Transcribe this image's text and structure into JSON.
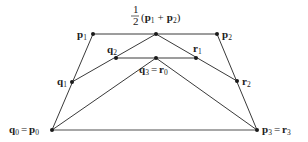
{
  "diagram": {
    "points": {
      "p0": {
        "name": "p",
        "sub": "0",
        "eq_name": "q",
        "eq_sub": "0"
      },
      "p1": {
        "name": "p",
        "sub": "1"
      },
      "p2": {
        "name": "p",
        "sub": "2"
      },
      "p3": {
        "name": "p",
        "sub": "3",
        "eq_name": "r",
        "eq_sub": "3"
      },
      "q1": {
        "name": "q",
        "sub": "1"
      },
      "q2": {
        "name": "q",
        "sub": "2"
      },
      "q3": {
        "name": "q",
        "sub": "3",
        "eq_name": "r",
        "eq_sub": "0"
      },
      "r1": {
        "name": "r",
        "sub": "1"
      },
      "r2": {
        "name": "r",
        "sub": "2"
      },
      "mid": {
        "frac_num": "1",
        "frac_den": "2",
        "open": "(",
        "a": "p",
        "a_sub": "1",
        "plus": "+",
        "b": "p",
        "b_sub": "2",
        "close": ")"
      }
    },
    "equals": "="
  }
}
